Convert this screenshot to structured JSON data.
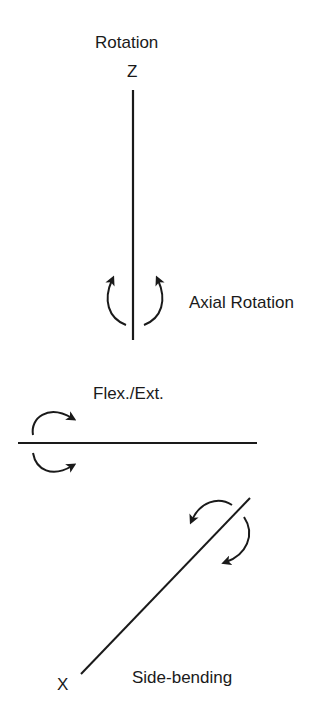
{
  "labels": {
    "rotation_title": "Rotation",
    "z_axis": "Z",
    "axial_rotation": "Axial Rotation",
    "flex_ext": "Flex./Ext.",
    "x_axis": "X",
    "side_bending": "Side-bending"
  },
  "colors": {
    "stroke": "#1a1a1a",
    "background": "#ffffff"
  }
}
